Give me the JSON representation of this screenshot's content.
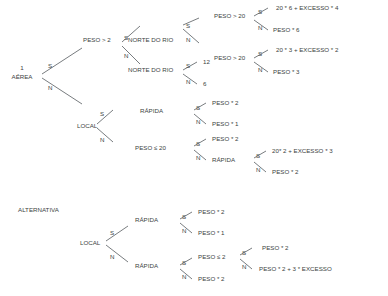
{
  "diagram": {
    "type": "decision-tree",
    "title_visible": false,
    "ink_color": "#3c3f42",
    "line_color": "#555a5e",
    "background_color": "#ffffff",
    "branch_yes": "S",
    "branch_no": "N",
    "sections": [
      {
        "id": "main",
        "label": ""
      },
      {
        "id": "alternativa",
        "label": "ALTERNATIVA"
      }
    ],
    "root_index": "1",
    "nodes": {
      "root": "AÉREA",
      "peso_gt_2": "PESO > 2",
      "local": "LOCAL",
      "norte_do_rio_1": "NORTE DO RIO",
      "norte_do_rio_2": "NORTE DO RIO",
      "peso_gt_20_a": "PESO > 20",
      "peso_gt_20_b": "PESO > 20",
      "rapida_1": "RÁPIDA",
      "peso_le_20": "PESO ≤ 20",
      "rapida_2": "RÁPIDA",
      "alt_local": "LOCAL",
      "alt_rapida_1": "RÁPIDA",
      "alt_rapida_2": "RÁPIDA",
      "alt_peso_le_2": "PESO ≤ 2"
    },
    "leaves": {
      "leaf_a1": "20 * 6 + EXCESSO * 4",
      "leaf_a2": "PESO * 6",
      "leaf_b1": "20 * 3 + EXCESSO * 2",
      "leaf_b2": "PESO * 3",
      "leaf_c1": "12",
      "leaf_c2": "6",
      "leaf_d1": "PESO * 2",
      "leaf_d2": "PESO * 1",
      "leaf_e1": "PESO * 2",
      "leaf_f1": "20* 2 + EXCESSO * 3",
      "leaf_f2": "PESO * 2",
      "leaf_g1": "PESO * 2",
      "leaf_g2": "PESO * 1",
      "leaf_h1": "PESO * 2",
      "leaf_h2": "PESO * 2 + 3 * EXCESSO",
      "leaf_i2": "PESO * 2"
    }
  }
}
